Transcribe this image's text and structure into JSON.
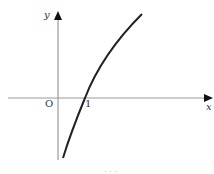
{
  "diagram": {
    "type": "function-graph",
    "axes": {
      "x_label": "x",
      "y_label": "y",
      "origin_label": "O",
      "tick_label": "1"
    },
    "curve": {
      "description": "increasing concave curve (logarithmic-like) crossing x-axis at x = 1",
      "x_intercept": 1
    },
    "colors": {
      "axis": "#9a9a9a",
      "curve": "#222222",
      "text": "#333333"
    },
    "caption_partial": "· · ·"
  }
}
